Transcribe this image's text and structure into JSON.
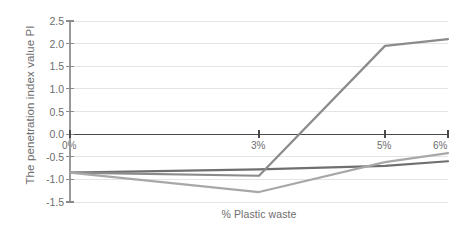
{
  "chart_data": {
    "type": "line",
    "title": "",
    "xlabel": "% Plastic waste",
    "ylabel": "The penetration index value PI",
    "x": [
      0,
      3,
      5,
      6
    ],
    "categories": [
      "0%",
      "3%",
      "5%",
      "6%"
    ],
    "xlim": [
      0,
      6
    ],
    "ylim": [
      -1.5,
      2.5
    ],
    "ytick_labels": [
      "2.5",
      "2.0",
      "1.5",
      "1.0",
      "0.5",
      "0.0",
      "-0.5",
      "-1.0",
      "-1.5"
    ],
    "ytick_values": [
      2.5,
      2.0,
      1.5,
      1.0,
      0.5,
      0.0,
      -0.5,
      -1.0,
      -1.5
    ],
    "grid": true,
    "grid_axis": "y",
    "legend": "none",
    "zero_line": 0.0,
    "series": [
      {
        "name": "series-dark",
        "color": "#6f6f6f",
        "values": [
          -0.85,
          -0.78,
          -0.7,
          -0.6
        ]
      },
      {
        "name": "series-rising",
        "color": "#8b8b8b",
        "values": [
          -0.85,
          -0.92,
          1.95,
          2.1
        ]
      },
      {
        "name": "series-light",
        "color": "#a8a8a8",
        "values": [
          -0.85,
          -1.28,
          -0.62,
          -0.42
        ]
      }
    ]
  },
  "axis": {
    "x_title": "% Plastic waste",
    "y_title": "The penetration index value PI"
  },
  "colors": {
    "grid": "#e4e4e4",
    "axis": "#5a5a5a",
    "text": "#6d6d6d",
    "background": "#ffffff"
  }
}
